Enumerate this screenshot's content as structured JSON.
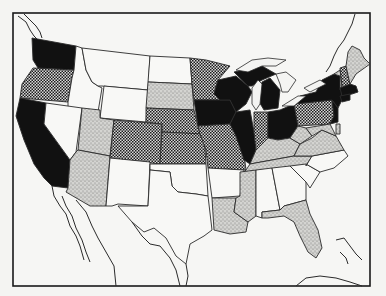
{
  "map": {
    "type": "choropleth",
    "region": "United States (contiguous) with portions of Canada, Mexico, Cuba and the Bahamas",
    "title": "",
    "legend": [],
    "colors": {
      "background": "#f4f4f2",
      "black": "#111111",
      "crosshatch_dark": "#1c1c1c",
      "crosshatch_light": "#d8d8d8",
      "stipple": "#c9c9c6",
      "white": "#f8f8f6",
      "outline": "#2a2a2a"
    },
    "categories": [
      {
        "name": "black",
        "pattern": "solid-black"
      },
      {
        "name": "crosshatch",
        "pattern": "checker"
      },
      {
        "name": "stipple",
        "pattern": "dotted-gray"
      },
      {
        "name": "white",
        "pattern": "none"
      }
    ],
    "states": [
      {
        "name": "Washington",
        "category": "black"
      },
      {
        "name": "Oregon",
        "category": "crosshatch"
      },
      {
        "name": "California",
        "category": "black"
      },
      {
        "name": "Idaho",
        "category": "white"
      },
      {
        "name": "Nevada",
        "category": "white"
      },
      {
        "name": "Montana",
        "category": "white"
      },
      {
        "name": "Wyoming",
        "category": "white"
      },
      {
        "name": "Utah",
        "category": "stipple"
      },
      {
        "name": "Arizona",
        "category": "stipple"
      },
      {
        "name": "Colorado",
        "category": "crosshatch"
      },
      {
        "name": "New Mexico",
        "category": "white"
      },
      {
        "name": "North Dakota",
        "category": "white"
      },
      {
        "name": "South Dakota",
        "category": "stipple"
      },
      {
        "name": "Nebraska",
        "category": "crosshatch"
      },
      {
        "name": "Kansas",
        "category": "crosshatch"
      },
      {
        "name": "Oklahoma",
        "category": "white"
      },
      {
        "name": "Texas",
        "category": "white"
      },
      {
        "name": "Minnesota",
        "category": "crosshatch"
      },
      {
        "name": "Iowa",
        "category": "black"
      },
      {
        "name": "Missouri",
        "category": "crosshatch"
      },
      {
        "name": "Arkansas",
        "category": "white"
      },
      {
        "name": "Louisiana",
        "category": "stipple"
      },
      {
        "name": "Wisconsin",
        "category": "black"
      },
      {
        "name": "Illinois",
        "category": "black"
      },
      {
        "name": "Michigan",
        "category": "black"
      },
      {
        "name": "Indiana",
        "category": "crosshatch"
      },
      {
        "name": "Ohio",
        "category": "black"
      },
      {
        "name": "Kentucky",
        "category": "stipple"
      },
      {
        "name": "Tennessee",
        "category": "stipple"
      },
      {
        "name": "Mississippi",
        "category": "stipple"
      },
      {
        "name": "Alabama",
        "category": "white"
      },
      {
        "name": "Georgia",
        "category": "white"
      },
      {
        "name": "Florida",
        "category": "stipple"
      },
      {
        "name": "South Carolina",
        "category": "white"
      },
      {
        "name": "North Carolina",
        "category": "white"
      },
      {
        "name": "Virginia",
        "category": "stipple"
      },
      {
        "name": "West Virginia",
        "category": "stipple"
      },
      {
        "name": "Pennsylvania",
        "category": "crosshatch"
      },
      {
        "name": "New York",
        "category": "black"
      },
      {
        "name": "New Jersey",
        "category": "black"
      },
      {
        "name": "Maryland",
        "category": "stipple"
      },
      {
        "name": "Delaware",
        "category": "stipple"
      },
      {
        "name": "Vermont",
        "category": "stipple"
      },
      {
        "name": "New Hampshire",
        "category": "crosshatch"
      },
      {
        "name": "Maine",
        "category": "stipple"
      },
      {
        "name": "Massachusetts",
        "category": "black"
      },
      {
        "name": "Connecticut",
        "category": "black"
      },
      {
        "name": "Rhode Island",
        "category": "black"
      }
    ]
  }
}
